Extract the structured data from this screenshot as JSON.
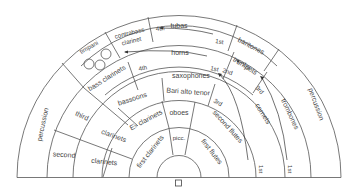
{
  "diagram": {
    "type": "band seating chart",
    "center": [
      179,
      177
    ],
    "colors": {
      "line": "#555555",
      "text": "#444444",
      "background": "#ffffff"
    },
    "conductor": {
      "symbol": "square",
      "label": ""
    },
    "sections": {
      "tubas": "tubas",
      "baritones": "baritones",
      "contrabass_clarinet": [
        "contrabass",
        "clarinet"
      ],
      "timpani": "timpani",
      "horns": "horns",
      "horns_order_start": "1st",
      "horns_order_end": "4th",
      "trumpets": "trumpets",
      "trumpets_order_start": "1st",
      "trumpets_order_end": "2nd",
      "bass_clarinets": "bass clarinets",
      "saxophones": "saxophones",
      "saxophones_order_start": "1st",
      "saxophones_order_end": "4th",
      "sax_types": "Bari alto tenor",
      "bassoons": "bassoons",
      "oboes": "oboes",
      "eb_clarinets": "E♭ clarinets",
      "picc": "picc.",
      "first_clarinets": "first clarinets",
      "first_flutes": "first flutes",
      "second_flutes": "second flutes",
      "second_flutes_order_start": "1st",
      "second_flutes_order_end": "3rd",
      "cornets": "cornets",
      "cornets_order_start": "1st",
      "cornets_order_end": "3rd",
      "trombones": "trombones",
      "percussion_left": "percussion",
      "percussion_right": "percussion",
      "third_label": "third",
      "second_label": "second",
      "clarinets_third": "clarinets",
      "clarinets_second": "clarinets"
    },
    "timpani_drums": 3
  }
}
